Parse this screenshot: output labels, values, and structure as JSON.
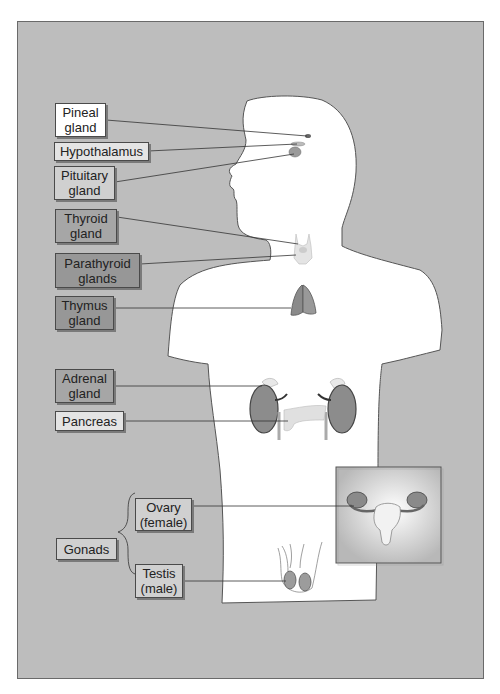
{
  "figure": {
    "labels": {
      "pineal": [
        "Pineal",
        "gland"
      ],
      "hypothalamus": [
        "Hypothalamus"
      ],
      "pituitary": [
        "Pituitary",
        "gland"
      ],
      "thyroid": [
        "Thyroid",
        "gland"
      ],
      "parathyroid": [
        "Parathyroid",
        "glands"
      ],
      "thymus": [
        "Thymus",
        "gland"
      ],
      "adrenal": [
        "Adrenal",
        "gland"
      ],
      "pancreas": [
        "Pancreas"
      ],
      "ovary": [
        "Ovary",
        "(female)"
      ],
      "testis": [
        "Testis",
        "(male)"
      ],
      "gonads": [
        "Gonads"
      ]
    },
    "colors": {
      "background": "#bdbdbd",
      "body": "#ffffff",
      "outline": "#555555",
      "organ": "#8a8a8a"
    }
  }
}
